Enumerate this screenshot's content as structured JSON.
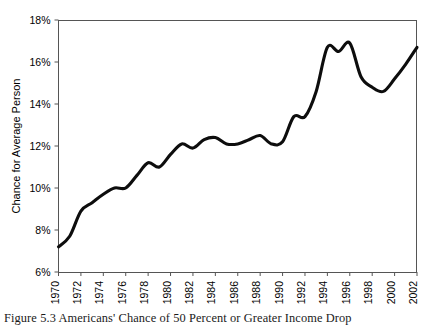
{
  "figure": {
    "caption": "Figure 5.3 Americans' Chance of 50 Percent or Greater Income Drop",
    "ylabel": "Chance for Average Person"
  },
  "chart_data": {
    "type": "line",
    "title": "",
    "xlabel": "",
    "ylabel": "Chance for Average Person",
    "xlim": [
      1970,
      2002
    ],
    "ylim": [
      6,
      18
    ],
    "yunit": "%",
    "grid": false,
    "legend": "none",
    "line_color": "#0d0d0d",
    "xtick_labels": [
      "1970",
      "1972",
      "1974",
      "1976",
      "1978",
      "1980",
      "1982",
      "1984",
      "1986",
      "1988",
      "1990",
      "1992",
      "1994",
      "1996",
      "1998",
      "2000",
      "2002"
    ],
    "ytick_labels": [
      "6%",
      "8%",
      "10%",
      "12%",
      "14%",
      "16%",
      "18%"
    ],
    "ytick_values": [
      6,
      8,
      10,
      12,
      14,
      16,
      18
    ],
    "x": [
      1970,
      1971,
      1972,
      1973,
      1974,
      1975,
      1976,
      1977,
      1978,
      1979,
      1980,
      1981,
      1982,
      1983,
      1984,
      1985,
      1986,
      1987,
      1988,
      1989,
      1990,
      1991,
      1992,
      1993,
      1994,
      1995,
      1996,
      1997,
      1998,
      1999,
      2000,
      2001,
      2002
    ],
    "values": [
      7.2,
      7.7,
      8.9,
      9.3,
      9.7,
      10.0,
      10.0,
      10.6,
      11.2,
      11.0,
      11.6,
      12.1,
      11.9,
      12.3,
      12.4,
      12.1,
      12.1,
      12.3,
      12.5,
      12.1,
      12.2,
      13.4,
      13.4,
      14.6,
      16.7,
      16.5,
      16.9,
      15.3,
      14.8,
      14.6,
      15.2,
      15.9,
      16.7
    ],
    "series": [
      {
        "name": "Chance for Average Person",
        "values": [
          7.2,
          7.7,
          8.9,
          9.3,
          9.7,
          10.0,
          10.0,
          10.6,
          11.2,
          11.0,
          11.6,
          12.1,
          11.9,
          12.3,
          12.4,
          12.1,
          12.1,
          12.3,
          12.5,
          12.1,
          12.2,
          13.4,
          13.4,
          14.6,
          16.7,
          16.5,
          16.9,
          15.3,
          14.8,
          14.6,
          15.2,
          15.9,
          16.7
        ]
      }
    ]
  }
}
